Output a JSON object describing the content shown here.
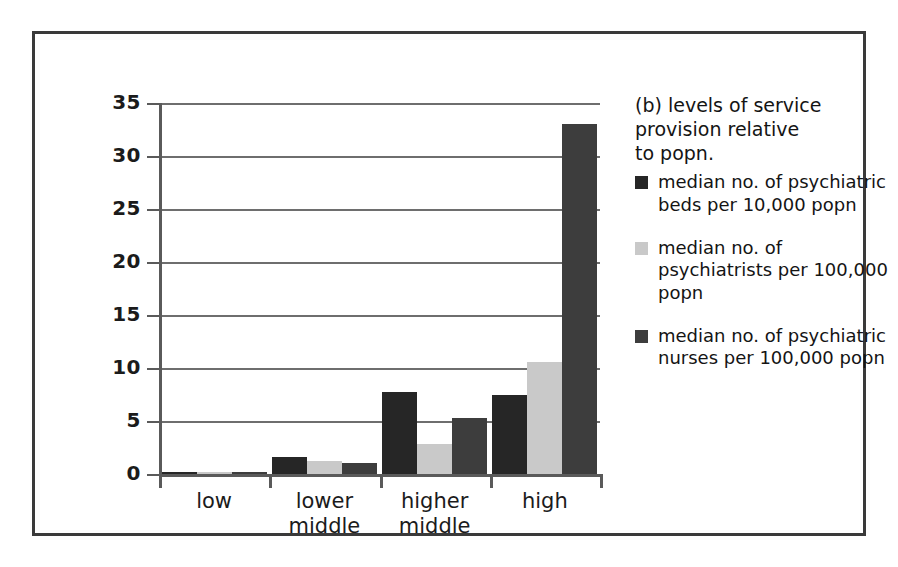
{
  "chart_data": {
    "type": "bar",
    "title": "(b) levels of service\nprovision relative\nto popn.",
    "xlabel": "",
    "ylabel": "",
    "categories": [
      "low",
      "lower\nmiddle",
      "higher\nmiddle",
      "high"
    ],
    "series": [
      {
        "name": "median no. of psychiatric beds per 10,000 popn",
        "color": "#262626",
        "values": [
          0.15,
          1.6,
          7.7,
          7.5
        ]
      },
      {
        "name": "median no. of psychiatrists per 100,000 popn",
        "color": "#c9c9c9",
        "values": [
          0.1,
          1.2,
          2.8,
          10.6
        ]
      },
      {
        "name": "median no. of psychiatric nurses per 100,000 popn",
        "color": "#3d3d3d",
        "values": [
          0.2,
          1.0,
          5.3,
          33.0
        ]
      }
    ],
    "ylim": [
      0,
      35
    ],
    "yticks": [
      0,
      5,
      10,
      15,
      20,
      25,
      30,
      35
    ],
    "ytick_labels": [
      "0",
      "5",
      "10",
      "15",
      "20",
      "25",
      "30",
      "35"
    ],
    "grid": true,
    "grid_axis": "y",
    "legend_position": "right"
  },
  "legend": {
    "title": "(b) levels of service\nprovision relative\nto popn.",
    "entries": [
      {
        "label": "median no. of psychiatric beds per 10,000 popn",
        "color": "#262626"
      },
      {
        "label": "median no. of psychiatrists per 100,000 popn",
        "color": "#c9c9c9"
      },
      {
        "label": "median no. of psychiatric nurses per 100,000 popn",
        "color": "#3d3d3d"
      }
    ]
  },
  "colors": {
    "series_1": "#262626",
    "series_2": "#c9c9c9",
    "series_3": "#3d3d3d",
    "axis": "#5a5a5a",
    "grid": "#6e6e6e",
    "frame": "#3a3a3a",
    "text": "#1b1b1b",
    "background": "#ffffff"
  }
}
